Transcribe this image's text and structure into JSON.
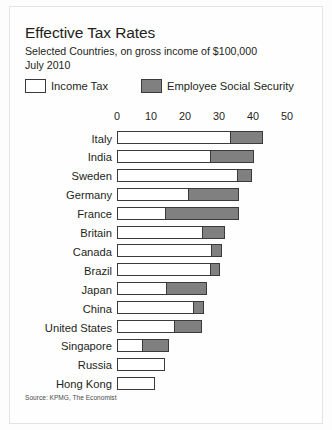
{
  "figure": {
    "title": "Effective Tax Rates",
    "subtitle_line1": "Selected Countries, on gross income of $100,000",
    "subtitle_line2": "July 2010",
    "source": "Source: KPMG, The Economist",
    "colors": {
      "income_tax": "#ffffff",
      "social_security": "#808080",
      "outline": "#3a3a3a",
      "background": "#fefefe",
      "text": "#231f20"
    }
  },
  "legend": {
    "position": "top",
    "items": [
      {
        "label": "Income Tax",
        "swatch": "white"
      },
      {
        "label": "Employee Social Security",
        "swatch": "grey"
      }
    ]
  },
  "chart_data": {
    "type": "bar",
    "orientation": "horizontal",
    "stacked": true,
    "title": "Effective Tax Rates",
    "subtitle": "Selected Countries, on gross income of $100,000 July 2010",
    "xlabel": "",
    "ylabel": "",
    "xlim": [
      0,
      50
    ],
    "xticks": [
      0,
      10,
      20,
      30,
      40,
      50
    ],
    "xtick_labels": [
      "0",
      "10",
      "20",
      "30",
      "40",
      "50"
    ],
    "grid": false,
    "legend": [
      "Income Tax",
      "Employee Social Security"
    ],
    "categories": [
      "Italy",
      "India",
      "Sweden",
      "Germany",
      "France",
      "Britain",
      "Canada",
      "Brazil",
      "Japan",
      "China",
      "United States",
      "Singapore",
      "Russia",
      "Hong Kong"
    ],
    "series": [
      {
        "name": "Income Tax",
        "values": [
          33.5,
          27.6,
          35.6,
          21.0,
          14.0,
          25.3,
          28.0,
          27.6,
          14.4,
          22.6,
          17.0,
          7.4,
          14.0,
          11.2
        ]
      },
      {
        "name": "Employee Social Security",
        "values": [
          9.5,
          12.7,
          4.1,
          15.0,
          22.0,
          6.5,
          2.8,
          2.8,
          12.1,
          2.9,
          8.0,
          7.9,
          0.0,
          0.0
        ]
      }
    ],
    "totals": [
      43.0,
      40.3,
      39.7,
      36.0,
      36.0,
      31.8,
      30.8,
      30.4,
      26.5,
      25.5,
      25.0,
      15.3,
      14.0,
      11.2
    ]
  }
}
